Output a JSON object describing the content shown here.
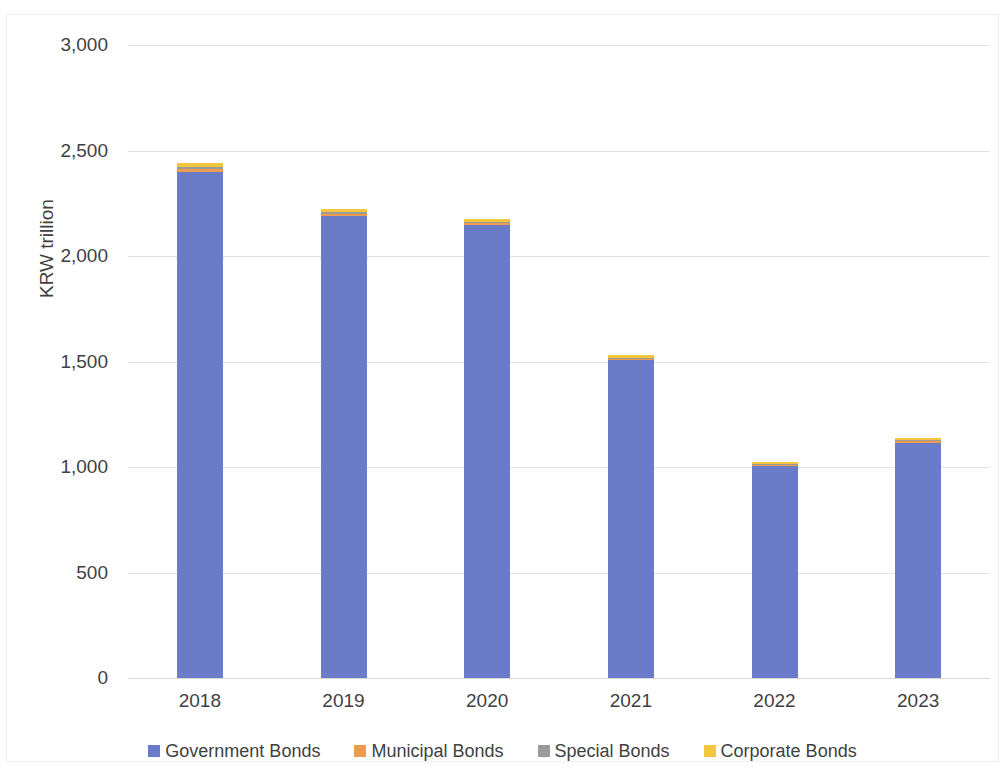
{
  "chart_data": {
    "type": "bar",
    "subtype": "stacked-column",
    "title": "",
    "subtitle": "",
    "xlabel": "",
    "ylabel": "KRW trillion",
    "categories": [
      "2018",
      "2019",
      "2020",
      "2021",
      "2022",
      "2023"
    ],
    "ylim": [
      0,
      3000
    ],
    "yticks": [
      0,
      500,
      1000,
      1500,
      2000,
      2500,
      3000
    ],
    "ytick_labels": [
      "0",
      "500",
      "1,000",
      "1,500",
      "2,000",
      "2,500",
      "3,000"
    ],
    "grid": true,
    "legend_position": "bottom",
    "series": [
      {
        "name": "Government Bonds",
        "color": "#6a7bc8",
        "values": [
          2398,
          2190,
          2145,
          1505,
          1005,
          1115
        ]
      },
      {
        "name": "Municipal Bonds",
        "color": "#ec9c4e",
        "values": [
          14,
          11,
          10,
          8,
          6,
          7
        ]
      },
      {
        "name": "Special Bonds",
        "color": "#9a9a9a",
        "values": [
          8,
          6,
          5,
          4,
          3,
          4
        ]
      },
      {
        "name": "Corporate Bonds",
        "color": "#f3c63f",
        "values": [
          20,
          18,
          16,
          12,
          11,
          12
        ]
      }
    ],
    "totals": [
      2440,
      2225,
      2176,
      1529,
      1025,
      1138
    ]
  },
  "axes": {
    "y_title": "KRW trillion",
    "y_tick_labels": [
      "3,000",
      "2,500",
      "2,000",
      "1,500",
      "1,000",
      "500",
      "0"
    ],
    "x_tick_labels": [
      "2018",
      "2019",
      "2020",
      "2021",
      "2022",
      "2023"
    ]
  },
  "legend": {
    "items": [
      {
        "label": "Government Bonds",
        "color": "#6a7bc8",
        "swatch": "square-swatch-blue"
      },
      {
        "label": "Municipal Bonds",
        "color": "#ec9c4e",
        "swatch": "square-swatch-orange"
      },
      {
        "label": "Special Bonds",
        "color": "#9a9a9a",
        "swatch": "square-swatch-gray"
      },
      {
        "label": "Corporate Bonds",
        "color": "#f3c63f",
        "swatch": "square-swatch-yellow"
      }
    ]
  }
}
